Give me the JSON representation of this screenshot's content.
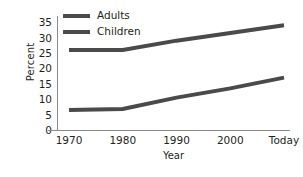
{
  "chart_data": {
    "type": "line",
    "title": "",
    "xlabel": "Year",
    "ylabel": "Percent",
    "categories": [
      "1970",
      "1980",
      "1990",
      "2000",
      "Today"
    ],
    "x": [
      1970,
      1980,
      1990,
      2000,
      2010
    ],
    "ylim": [
      0,
      37
    ],
    "yticks": [
      0,
      5,
      10,
      15,
      20,
      25,
      30,
      35
    ],
    "ytick_labels": [
      "0",
      "5",
      "10",
      "15",
      "20",
      "25",
      "30",
      "35"
    ],
    "grid": false,
    "legend_position": "top-left inside",
    "series": [
      {
        "name": "Adults",
        "color": "#4a4a4a",
        "values": [
          26,
          26,
          29,
          31.5,
          34
        ]
      },
      {
        "name": "Children",
        "color": "#4a4a4a",
        "values": [
          6.5,
          6.8,
          10.5,
          13.5,
          17
        ]
      }
    ]
  },
  "axes": {
    "y_title": "Percent",
    "x_title": "Year",
    "axis_color": "#8a8a8a"
  },
  "legend": {
    "items": [
      {
        "label": "Adults",
        "swatch_color": "#4a4a4a"
      },
      {
        "label": "Children",
        "swatch_color": "#4a4a4a"
      }
    ]
  }
}
